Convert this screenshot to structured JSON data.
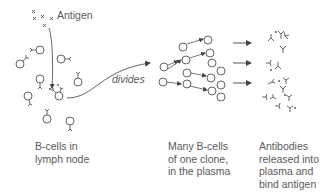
{
  "labels": {
    "antigen": "Antigen",
    "divides": "divides"
  },
  "captions": {
    "b_cells_lymph": [
      "B-cells in",
      "lymph node"
    ],
    "clone_plasma": [
      "Many B-cells",
      "of one clone,",
      "in the plasma"
    ],
    "antibodies": [
      "Antibodies",
      "released into",
      "plasma and",
      "bind antigen"
    ]
  },
  "colors": {
    "stroke": "#555555",
    "text": "#5a5a5a",
    "background": "#ffffff"
  },
  "stages": [
    {
      "name": "B-cells in lymph node",
      "element": "B-cell with receptor",
      "count": 10
    },
    {
      "name": "Clonal expansion",
      "element": "B-cell",
      "count": 14
    },
    {
      "name": "Antibody release",
      "element": "Y-shaped antibody",
      "count": 16
    }
  ]
}
